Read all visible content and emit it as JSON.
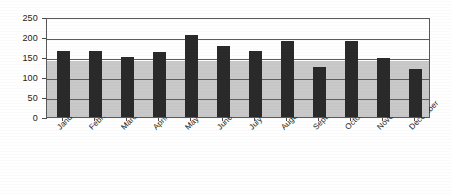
{
  "chart_data": {
    "type": "bar",
    "title": "",
    "subtitle": "",
    "xlabel": "",
    "ylabel": "",
    "ylim": [
      0,
      250
    ],
    "ytick_step": 50,
    "yticks": [
      "0",
      "50",
      "100",
      "150",
      "200",
      "250"
    ],
    "grid": true,
    "legend": false,
    "legend_position": "none",
    "categories": [
      "January",
      "February",
      "March",
      "April",
      "May",
      "June",
      "July",
      "August",
      "September",
      "October",
      "November",
      "December"
    ],
    "values": [
      165,
      165,
      150,
      163,
      205,
      178,
      165,
      190,
      125,
      190,
      148,
      120
    ],
    "series": [
      {
        "name": "Monthly value",
        "values": [
          165,
          165,
          150,
          163,
          205,
          178,
          165,
          190,
          125,
          190,
          148,
          120
        ],
        "color": "#2a2a2a"
      }
    ],
    "background_band": {
      "from": 0,
      "to": 140,
      "color": "#c9c9c9"
    },
    "colors": {
      "bar": "#2a2a2a",
      "band": "#c9c9c9",
      "gridline": "#5d5d60",
      "frame": "#59595c",
      "text": "#1a1a1a",
      "background": "#ffffff"
    }
  }
}
